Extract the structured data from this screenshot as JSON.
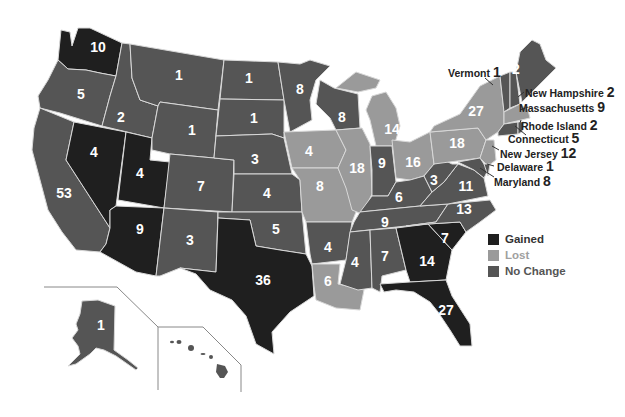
{
  "colors": {
    "gained": "#1f1f1f",
    "lost": "#9a9a9a",
    "no_change": "#555555",
    "border": "#d8d8d8",
    "inset_line": "#888888"
  },
  "legend": {
    "items": [
      {
        "key": "gained",
        "label": "Gained",
        "color": "#1f1f1f",
        "text_color": "#333333"
      },
      {
        "key": "lost",
        "label": "Lost",
        "color": "#9a9a9a",
        "text_color": "#a0a0a0"
      },
      {
        "key": "no_change",
        "label": "No Change",
        "color": "#555555",
        "text_color": "#555555"
      }
    ]
  },
  "states": [
    {
      "abbr": "WA",
      "value": "10",
      "status": "gained"
    },
    {
      "abbr": "OR",
      "value": "5",
      "status": "no_change"
    },
    {
      "abbr": "CA",
      "value": "53",
      "status": "no_change"
    },
    {
      "abbr": "ID",
      "value": "2",
      "status": "no_change"
    },
    {
      "abbr": "NV",
      "value": "4",
      "status": "gained"
    },
    {
      "abbr": "UT",
      "value": "4",
      "status": "gained"
    },
    {
      "abbr": "AZ",
      "value": "9",
      "status": "gained"
    },
    {
      "abbr": "MT",
      "value": "1",
      "status": "no_change"
    },
    {
      "abbr": "WY",
      "value": "1",
      "status": "no_change"
    },
    {
      "abbr": "CO",
      "value": "7",
      "status": "no_change"
    },
    {
      "abbr": "NM",
      "value": "3",
      "status": "no_change"
    },
    {
      "abbr": "ND",
      "value": "1",
      "status": "no_change"
    },
    {
      "abbr": "SD",
      "value": "1",
      "status": "no_change"
    },
    {
      "abbr": "NE",
      "value": "3",
      "status": "no_change"
    },
    {
      "abbr": "KS",
      "value": "4",
      "status": "no_change"
    },
    {
      "abbr": "OK",
      "value": "5",
      "status": "no_change"
    },
    {
      "abbr": "TX",
      "value": "36",
      "status": "gained"
    },
    {
      "abbr": "MN",
      "value": "8",
      "status": "no_change"
    },
    {
      "abbr": "IA",
      "value": "4",
      "status": "lost"
    },
    {
      "abbr": "MO",
      "value": "8",
      "status": "lost"
    },
    {
      "abbr": "AR",
      "value": "4",
      "status": "no_change"
    },
    {
      "abbr": "LA",
      "value": "6",
      "status": "lost"
    },
    {
      "abbr": "WI",
      "value": "8",
      "status": "no_change"
    },
    {
      "abbr": "IL",
      "value": "18",
      "status": "lost"
    },
    {
      "abbr": "MI",
      "value": "14",
      "status": "lost"
    },
    {
      "abbr": "IN",
      "value": "9",
      "status": "no_change"
    },
    {
      "abbr": "OH",
      "value": "16",
      "status": "lost"
    },
    {
      "abbr": "KY",
      "value": "6",
      "status": "no_change"
    },
    {
      "abbr": "TN",
      "value": "9",
      "status": "no_change"
    },
    {
      "abbr": "MS",
      "value": "4",
      "status": "no_change"
    },
    {
      "abbr": "AL",
      "value": "7",
      "status": "no_change"
    },
    {
      "abbr": "GA",
      "value": "14",
      "status": "gained"
    },
    {
      "abbr": "FL",
      "value": "27",
      "status": "gained"
    },
    {
      "abbr": "SC",
      "value": "7",
      "status": "gained"
    },
    {
      "abbr": "NC",
      "value": "13",
      "status": "no_change"
    },
    {
      "abbr": "VA",
      "value": "11",
      "status": "no_change"
    },
    {
      "abbr": "WV",
      "value": "3",
      "status": "no_change"
    },
    {
      "abbr": "PA",
      "value": "18",
      "status": "lost"
    },
    {
      "abbr": "NY",
      "value": "27",
      "status": "lost"
    },
    {
      "abbr": "ME",
      "value": "2",
      "status": "no_change"
    },
    {
      "abbr": "AK",
      "value": "1",
      "status": "no_change"
    },
    {
      "abbr": "HI",
      "value": "2",
      "status": "no_change"
    }
  ],
  "callouts": [
    {
      "name": "Vermont",
      "value": "1",
      "status": "no_change"
    },
    {
      "name": "New Hampshire",
      "value": "2",
      "status": "no_change"
    },
    {
      "name": "Massachusetts",
      "value": "9",
      "status": "lost"
    },
    {
      "name": "Rhode Island",
      "value": "2",
      "status": "no_change"
    },
    {
      "name": "Connecticut",
      "value": "5",
      "status": "no_change"
    },
    {
      "name": "New Jersey",
      "value": "12",
      "status": "lost"
    },
    {
      "name": "Delaware",
      "value": "1",
      "status": "no_change"
    },
    {
      "name": "Maryland",
      "value": "8",
      "status": "no_change"
    }
  ]
}
